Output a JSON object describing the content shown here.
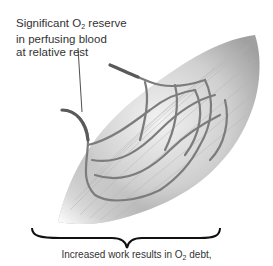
{
  "figure": {
    "top_label": {
      "line1_pre": "Significant O",
      "line1_sub": "2",
      "line1_post": " reserve",
      "line2": "in perfusing blood",
      "line3": "at relative rest"
    },
    "bottom_label": {
      "pre": "Increased work results in O",
      "sub": "2",
      "post": " debt,"
    },
    "colors": {
      "text": "#333333",
      "muscle_light": "#e6e6e6",
      "muscle_dark": "#9a9a9a",
      "vessel": "#7a7a7a",
      "brace": "#111111"
    }
  }
}
